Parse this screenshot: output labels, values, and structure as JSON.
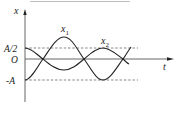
{
  "figure": {
    "type": "oscillation-graph",
    "axes": {
      "y_label": "x",
      "x_label": "t",
      "origin_label": "O",
      "y_ticks": [
        "A/2",
        "O",
        "-A"
      ]
    },
    "curves": [
      {
        "name": "x1",
        "label": "x",
        "subscript": "1",
        "description": "amplitude A, starts at -A"
      },
      {
        "name": "x2",
        "label": "x",
        "subscript": "2",
        "description": "amplitude A/2, starts at A/2"
      }
    ],
    "reference_lines": [
      "A/2",
      "-A"
    ],
    "colors": {
      "stroke": "#222222",
      "dashed": "#555555",
      "background": "#ffffff"
    }
  }
}
